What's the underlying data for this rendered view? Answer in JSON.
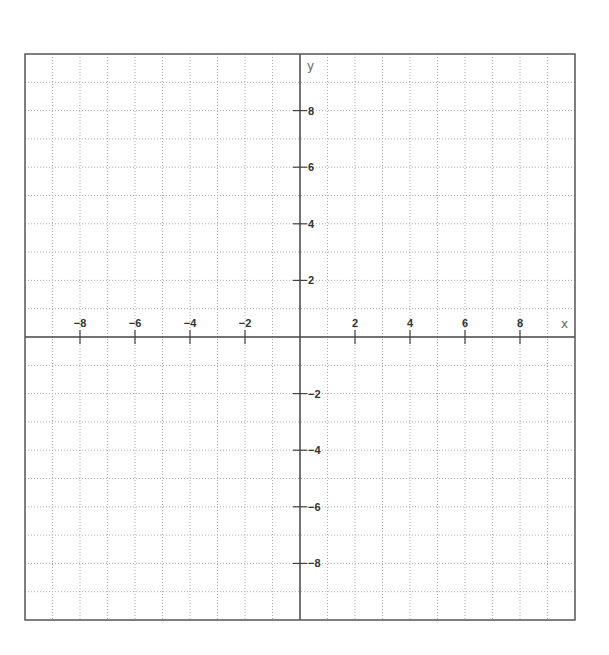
{
  "chart_data": {
    "type": "coordinate-grid",
    "title": "",
    "xlabel": "x",
    "ylabel": "y",
    "xlim": [
      -10,
      10
    ],
    "ylim": [
      -10,
      10
    ],
    "grid": true,
    "grid_step": 1,
    "x_ticks": [
      -8,
      -6,
      -4,
      -2,
      2,
      4,
      6,
      8
    ],
    "y_ticks": [
      8,
      6,
      4,
      2,
      -2,
      -4,
      -6,
      -8
    ],
    "x_tick_labels": [
      "−8",
      "−6",
      "−4",
      "−2",
      "2",
      "4",
      "6",
      "8"
    ],
    "y_tick_labels": [
      "8",
      "6",
      "4",
      "2",
      "−2",
      "−4",
      "−6",
      "−8"
    ],
    "series": []
  },
  "colors": {
    "border": "#555555",
    "axis": "#444444",
    "grid": "#aaaaaa",
    "label": "#333333"
  },
  "layout": {
    "left": 25,
    "top": 54,
    "right": 575,
    "bottom": 620,
    "origin_x": 300,
    "origin_y": 337
  }
}
